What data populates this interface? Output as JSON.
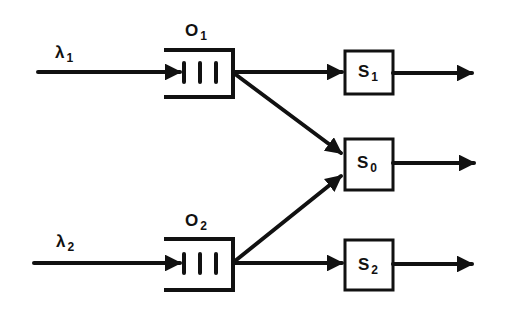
{
  "diagram": {
    "type": "queueing-network",
    "colors": {
      "stroke": "#111111",
      "background": "#ffffff"
    },
    "inputs": [
      {
        "id": "lambda1",
        "symbol": "λ",
        "subscript": "1",
        "target": "queue1"
      },
      {
        "id": "lambda2",
        "symbol": "λ",
        "subscript": "2",
        "target": "queue2"
      }
    ],
    "queues": [
      {
        "id": "queue1",
        "symbol": "O",
        "subscript": "1"
      },
      {
        "id": "queue2",
        "symbol": "O",
        "subscript": "2"
      }
    ],
    "servers": [
      {
        "id": "server1",
        "symbol": "S",
        "subscript": "1"
      },
      {
        "id": "server0",
        "symbol": "S",
        "subscript": "0"
      },
      {
        "id": "server2",
        "symbol": "S",
        "subscript": "2"
      }
    ],
    "edges": [
      {
        "from": "queue1",
        "to": "server1"
      },
      {
        "from": "queue1",
        "to": "server0"
      },
      {
        "from": "queue2",
        "to": "server0"
      },
      {
        "from": "queue2",
        "to": "server2"
      },
      {
        "from": "server1",
        "to": "output"
      },
      {
        "from": "server0",
        "to": "output"
      },
      {
        "from": "server2",
        "to": "output"
      }
    ]
  }
}
